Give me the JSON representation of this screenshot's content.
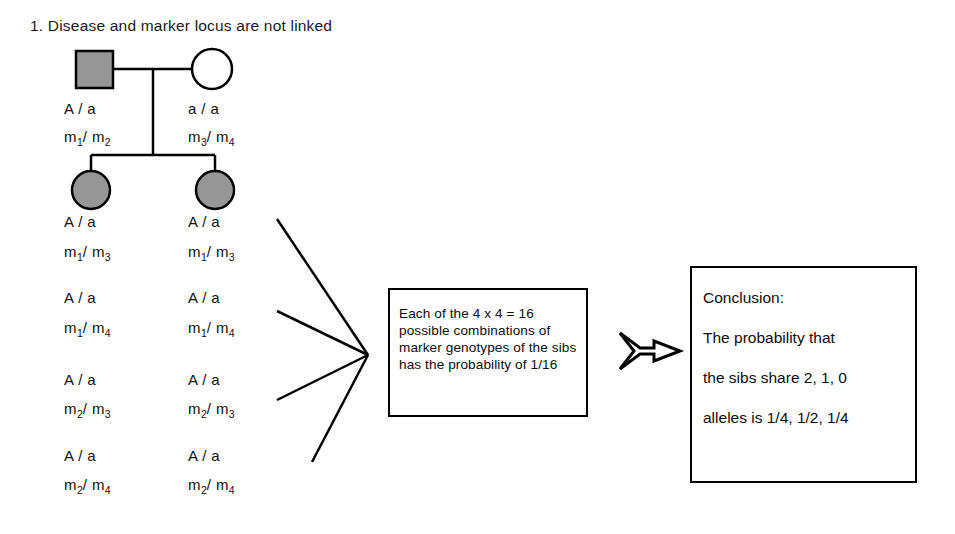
{
  "title": "1. Disease and marker locus are not linked",
  "pedigree": {
    "father": {
      "symbol": "filled-square",
      "disease_genotype": "A / a",
      "marker_alleles": [
        "m",
        "1",
        "m",
        "2"
      ],
      "marker_genotype": "m1/ m2"
    },
    "mother": {
      "symbol": "open-circle",
      "disease_genotype": "a / a",
      "marker_alleles": [
        "m",
        "3",
        "m",
        "4"
      ],
      "marker_genotype": "m3/ m4"
    },
    "sib_left": {
      "symbol": "filled-circle",
      "genotypes": [
        {
          "disease": "A / a",
          "marker_prefix": "m",
          "marker_sub1": "1",
          "marker_mid": "/ m",
          "marker_sub2": "3"
        },
        {
          "disease": "A / a",
          "marker_prefix": "m",
          "marker_sub1": "1",
          "marker_mid": "/ m",
          "marker_sub2": "4"
        },
        {
          "disease": "A / a",
          "marker_prefix": "m",
          "marker_sub1": "2",
          "marker_mid": "/ m",
          "marker_sub2": "3"
        },
        {
          "disease": "A / a",
          "marker_prefix": "m",
          "marker_sub1": "2",
          "marker_mid": "/ m",
          "marker_sub2": "4"
        }
      ]
    },
    "sib_right": {
      "symbol": "filled-circle",
      "genotypes": [
        {
          "disease": "A / a",
          "marker_prefix": "m",
          "marker_sub1": "1",
          "marker_mid": "/ m",
          "marker_sub2": "3"
        },
        {
          "disease": "A / a",
          "marker_prefix": "m",
          "marker_sub1": "1",
          "marker_mid": "/ m",
          "marker_sub2": "4"
        },
        {
          "disease": "A / a",
          "marker_prefix": "m",
          "marker_sub1": "2",
          "marker_mid": "/ m",
          "marker_sub2": "3"
        },
        {
          "disease": "A / a",
          "marker_prefix": "m",
          "marker_sub1": "2",
          "marker_mid": "/ m",
          "marker_sub2": "4"
        }
      ]
    }
  },
  "middle_box": {
    "text": "Each of the 4 x 4 = 16 possible combinations of marker genotypes of the sibs has the probability of 1/16"
  },
  "conclusion_box": {
    "line1": "Conclusion:",
    "line2": "The probability that",
    "line3": "the sibs share 2, 1, 0",
    "line4": "alleles is 1/4, 1/2, 1/4"
  },
  "colors": {
    "stroke": "#000000",
    "affected_fill": "#969696",
    "background": "#ffffff"
  }
}
